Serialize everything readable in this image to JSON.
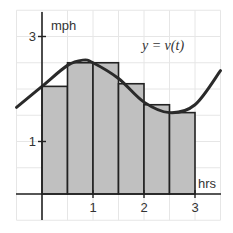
{
  "chart_data": {
    "type": "bar",
    "title": "",
    "xlabel": "hrs",
    "ylabel": "mph",
    "curve_label": "y = v(t)",
    "x_ticks": [
      "1",
      "2",
      "3"
    ],
    "y_ticks": [
      "1",
      "3"
    ],
    "xlim": [
      -0.5,
      3.5
    ],
    "ylim": [
      -0.5,
      3.5
    ],
    "grid": true,
    "bar_width": 0.5,
    "bars": [
      {
        "x0": 0.0,
        "x1": 0.5,
        "height": 2.05
      },
      {
        "x0": 0.5,
        "x1": 1.0,
        "height": 2.5
      },
      {
        "x0": 1.0,
        "x1": 1.5,
        "height": 2.5
      },
      {
        "x0": 1.5,
        "x1": 2.0,
        "height": 2.1
      },
      {
        "x0": 2.0,
        "x1": 2.5,
        "height": 1.7
      },
      {
        "x0": 2.5,
        "x1": 3.0,
        "height": 1.55
      }
    ],
    "curve": {
      "name": "v(t)",
      "x": [
        -0.5,
        0.0,
        0.5,
        0.8,
        1.0,
        1.5,
        2.0,
        2.5,
        3.0,
        3.5
      ],
      "y": [
        1.65,
        2.05,
        2.45,
        2.55,
        2.5,
        2.2,
        1.75,
        1.55,
        1.7,
        2.35
      ]
    },
    "colors": {
      "bar_fill": "#c0c0c0",
      "bar_stroke": "#222222",
      "curve": "#2a2a2a",
      "grid": "#e6e6e6",
      "axis": "#222222"
    }
  }
}
